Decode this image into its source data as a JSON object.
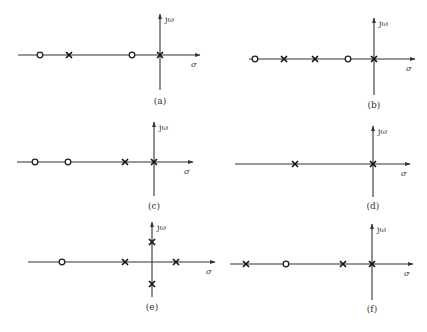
{
  "axis_labels": {
    "imag": "jω",
    "real": "σ"
  },
  "colors": {
    "ink": "#222222",
    "background": "#ffffff"
  },
  "panels": [
    {
      "id": "a",
      "caption": "(a)",
      "origin": [
        160,
        55
      ],
      "line_start": 18,
      "arrow_end": 200,
      "v_top": 14,
      "v_bottom": 90,
      "caption_y": 104,
      "zeros": [
        [
          40,
          55
        ],
        [
          132,
          55
        ]
      ],
      "poles": [
        [
          69,
          55
        ],
        [
          160,
          55
        ]
      ]
    },
    {
      "id": "b",
      "caption": "(b)",
      "origin": [
        374,
        59
      ],
      "line_start": 249,
      "arrow_end": 415,
      "v_top": 18,
      "v_bottom": 95,
      "caption_y": 108,
      "zeros": [
        [
          255,
          59
        ],
        [
          348,
          59
        ]
      ],
      "poles": [
        [
          284,
          59
        ],
        [
          315,
          59
        ],
        [
          374,
          59
        ]
      ]
    },
    {
      "id": "c",
      "caption": "(c)",
      "origin": [
        154,
        162
      ],
      "line_start": 17,
      "arrow_end": 193,
      "v_top": 122,
      "v_bottom": 196,
      "caption_y": 209,
      "zeros": [
        [
          35,
          162
        ],
        [
          68,
          162
        ]
      ],
      "poles": [
        [
          125,
          162
        ],
        [
          154,
          162
        ]
      ]
    },
    {
      "id": "d",
      "caption": "(d)",
      "origin": [
        373,
        164
      ],
      "line_start": 235,
      "arrow_end": 410,
      "v_top": 126,
      "v_bottom": 197,
      "caption_y": 209,
      "zeros": [],
      "poles": [
        [
          295,
          164
        ],
        [
          373,
          164
        ]
      ]
    },
    {
      "id": "e",
      "caption": "(e)",
      "origin": [
        152,
        262
      ],
      "line_start": 28,
      "arrow_end": 215,
      "v_top": 222,
      "v_bottom": 297,
      "caption_y": 310,
      "zeros": [
        [
          62,
          262
        ]
      ],
      "poles": [
        [
          125,
          262
        ],
        [
          176,
          262
        ],
        [
          152,
          242
        ],
        [
          152,
          284
        ]
      ]
    },
    {
      "id": "f",
      "caption": "(f)",
      "origin": [
        372,
        264
      ],
      "line_start": 230,
      "arrow_end": 413,
      "v_top": 224,
      "v_bottom": 300,
      "caption_y": 312,
      "zeros": [
        [
          286,
          264
        ]
      ],
      "poles": [
        [
          246,
          264
        ],
        [
          343,
          264
        ],
        [
          372,
          264
        ]
      ]
    }
  ]
}
